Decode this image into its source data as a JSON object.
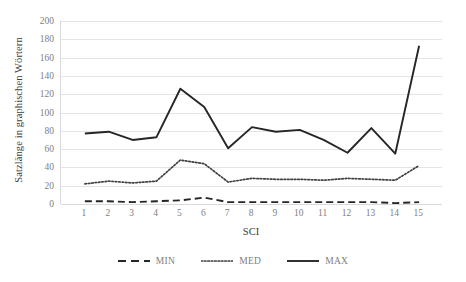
{
  "chart_data": {
    "type": "line",
    "title": "",
    "xlabel": "SCI",
    "ylabel": "Satzlänge in graphischen Wörtern",
    "x": [
      1,
      2,
      3,
      4,
      5,
      6,
      7,
      8,
      9,
      10,
      11,
      12,
      13,
      14,
      15
    ],
    "categories": [
      "1",
      "2",
      "3",
      "4",
      "5",
      "6",
      "7",
      "8",
      "9",
      "10",
      "11",
      "12",
      "13",
      "14",
      "15"
    ],
    "series": [
      {
        "name": "MIN",
        "style": "dashed",
        "color": "#262626",
        "values": [
          3,
          3,
          2,
          3,
          4,
          7,
          2,
          2,
          2,
          2,
          2,
          2,
          2,
          1,
          2
        ]
      },
      {
        "name": "MED",
        "style": "dotted",
        "color": "#404040",
        "values": [
          22,
          25,
          23,
          25,
          48,
          44,
          24,
          28,
          27,
          27,
          26,
          28,
          27,
          26,
          42
        ]
      },
      {
        "name": "MAX",
        "style": "solid",
        "color": "#262626",
        "values": [
          77,
          79,
          70,
          73,
          126,
          106,
          61,
          84,
          79,
          81,
          70,
          56,
          83,
          55,
          173
        ]
      }
    ],
    "ylim": [
      0,
      200
    ],
    "ytick_step": 20,
    "yticks": [
      200,
      180,
      160,
      140,
      120,
      100,
      80,
      60,
      40,
      20,
      0
    ],
    "ytick_labels": [
      "200",
      "180",
      "160",
      "140",
      "120",
      "100",
      "80",
      "60",
      "40",
      "20",
      "0"
    ],
    "grid": "horizontal",
    "legend_position": "bottom",
    "gridline_color": "#e4e4e4",
    "axis_color": "#d9d9d9",
    "tick_label_color": "#808080",
    "axis_title_color": "#404040",
    "background": "#ffffff"
  },
  "legend": {
    "items": [
      {
        "label": "MIN",
        "style": "dashed"
      },
      {
        "label": "MED",
        "style": "dotted"
      },
      {
        "label": "MAX",
        "style": "solid"
      }
    ]
  }
}
